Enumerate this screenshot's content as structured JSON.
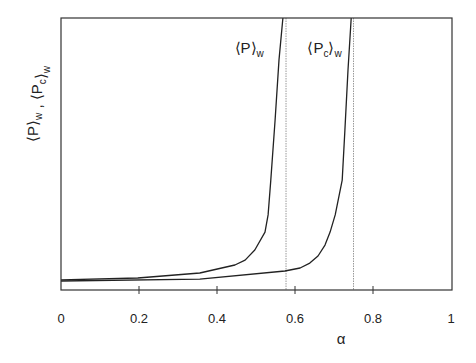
{
  "chart_data": {
    "type": "line",
    "title": "",
    "xlabel": "α",
    "ylabel": {
      "parts": [
        {
          "text": "⟨P⟩",
          "sub": "w"
        },
        {
          "text": " , ⟨P",
          "sub": "c"
        },
        {
          "text": "⟩",
          "sub": "w"
        }
      ]
    },
    "xlim": [
      0,
      1
    ],
    "ylim": [
      0,
      1
    ],
    "y_units": "normalized (no y ticks shown)",
    "grid": false,
    "x_ticks": [
      0,
      0.2,
      0.4,
      0.6,
      0.8,
      1
    ],
    "x_tick_labels": [
      "0",
      "0.2",
      "0.4",
      "0.6",
      "0.8",
      "1"
    ],
    "series": [
      {
        "name": "⟨P⟩w",
        "label_main": "⟨P⟩",
        "label_sub": "w",
        "label_anchor": {
          "x": 0.445,
          "y": 0.87
        },
        "x": [
          0,
          0.197,
          0.356,
          0.446,
          0.472,
          0.497,
          0.523,
          0.531,
          0.538,
          0.549,
          0.559,
          0.569
        ],
        "y": [
          0.037,
          0.044,
          0.0625,
          0.092,
          0.11,
          0.147,
          0.213,
          0.276,
          0.404,
          0.625,
          0.846,
          1.0
        ]
      },
      {
        "name": "⟨Pc⟩w",
        "label_main": "⟨P",
        "label_mid_sub": "c",
        "label_end": "⟩",
        "label_sub": "w",
        "label_anchor": {
          "x": 0.632,
          "y": 0.87
        },
        "x": [
          0,
          0.356,
          0.574,
          0.613,
          0.638,
          0.659,
          0.677,
          0.69,
          0.703,
          0.721,
          0.728,
          0.736,
          0.744
        ],
        "y": [
          0.033,
          0.04,
          0.07,
          0.081,
          0.099,
          0.125,
          0.165,
          0.213,
          0.276,
          0.404,
          0.588,
          0.809,
          1.0
        ]
      }
    ],
    "vertical_lines": [
      {
        "x": 0.577,
        "style": "dotted",
        "color": "#999999"
      },
      {
        "x": 0.75,
        "style": "dotted",
        "color": "#999999"
      }
    ],
    "colors": {
      "axis": "#333333",
      "curve": "#222222",
      "text": "#222222"
    }
  }
}
